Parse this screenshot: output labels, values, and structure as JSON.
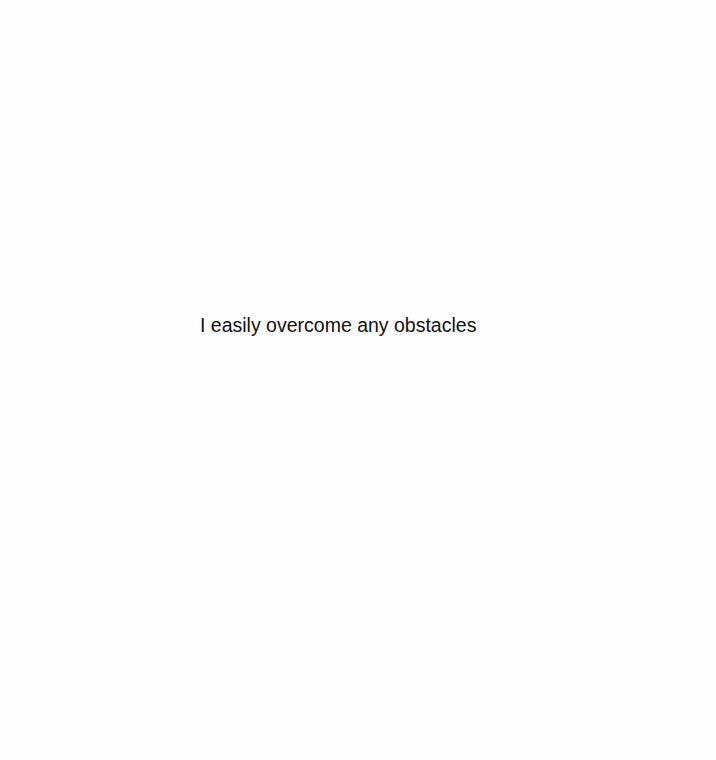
{
  "page": {
    "background_color": "#fefefe",
    "text_color": "#111111",
    "text": "I easily overcome any obstacles"
  }
}
